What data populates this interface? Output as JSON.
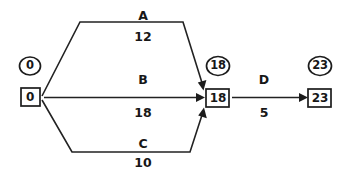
{
  "diagram": {
    "type": "activity-on-arrow-network",
    "colors": {
      "line": "#222222",
      "text": "#171717",
      "background": "#ffffff"
    },
    "nodes": [
      {
        "id": "start",
        "circle_value": "0",
        "box_value": "0",
        "circle_center": [
          30,
          66
        ],
        "box_center": [
          30,
          97
        ]
      },
      {
        "id": "merge",
        "circle_value": "18",
        "box_value": "18",
        "circle_center": [
          218,
          66
        ],
        "box_center": [
          218,
          98
        ]
      },
      {
        "id": "finish",
        "circle_value": "23",
        "box_value": "23",
        "circle_center": [
          320,
          66
        ],
        "box_center": [
          320,
          98
        ]
      }
    ],
    "activities": [
      {
        "name": "A",
        "duration": "12",
        "from": "start",
        "to": "merge",
        "label_pos": [
          143,
          16
        ],
        "duration_pos": [
          143,
          37
        ]
      },
      {
        "name": "B",
        "duration": "18",
        "from": "start",
        "to": "merge",
        "label_pos": [
          143,
          80
        ],
        "duration_pos": [
          143,
          113
        ]
      },
      {
        "name": "C",
        "duration": "10",
        "from": "start",
        "to": "merge",
        "label_pos": [
          143,
          144
        ],
        "duration_pos": [
          143,
          163
        ]
      },
      {
        "name": "D",
        "duration": "5",
        "from": "merge",
        "to": "finish",
        "label_pos": [
          264,
          80
        ],
        "duration_pos": [
          264,
          113
        ]
      }
    ]
  }
}
